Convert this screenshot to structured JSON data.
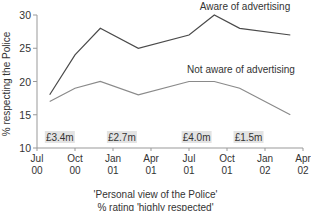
{
  "chart_data": {
    "type": "line",
    "title": "'Personal view of the Police'",
    "subtitle": "% rating 'highly respected'",
    "xlabel": "",
    "ylabel": "% respecting the Police",
    "ylim": [
      10,
      30
    ],
    "yticks": [
      10,
      15,
      20,
      25,
      30
    ],
    "xticks": [
      {
        "label": [
          "Jul",
          "00"
        ],
        "month": 0
      },
      {
        "label": [
          "Oct",
          "00"
        ],
        "month": 3
      },
      {
        "label": [
          "Jan",
          "01"
        ],
        "month": 6
      },
      {
        "label": [
          "Apr",
          "01"
        ],
        "month": 9
      },
      {
        "label": [
          "Jul",
          "01"
        ],
        "month": 12
      },
      {
        "label": [
          "Oct",
          "01"
        ],
        "month": 15
      },
      {
        "label": [
          "Jan",
          "02"
        ],
        "month": 18
      },
      {
        "label": [
          "Apr",
          "02"
        ],
        "month": 21
      }
    ],
    "x": [
      "Aug 00",
      "Oct 00",
      "Dec 00",
      "Mar 01",
      "Jul 01",
      "Sep 01",
      "Nov 01",
      "Mar 02"
    ],
    "x_month": [
      1,
      3,
      5,
      8,
      12,
      14,
      16,
      20
    ],
    "series": [
      {
        "name": "Aware of advertising",
        "values": [
          18,
          24,
          28,
          25,
          27,
          30,
          28,
          27
        ],
        "color": "#4a4a4a",
        "label_pos": {
          "x": 245,
          "y": 10
        }
      },
      {
        "name": "Not aware of advertising",
        "values": [
          17,
          19,
          20,
          18,
          20,
          20,
          19,
          15
        ],
        "color": "#8a8a8a",
        "label_pos": {
          "x": 241,
          "y": 73
        }
      }
    ],
    "annotations": [
      {
        "text": "£3.4m",
        "month": 1.8
      },
      {
        "text": "£2.7m",
        "month": 6.7
      },
      {
        "text": "£4.0m",
        "month": 12.6
      },
      {
        "text": "£1.5m",
        "month": 16.7
      }
    ],
    "grid": false,
    "legend": "inline labels"
  },
  "caption": {
    "line1": "'Personal view of the Police'",
    "line2": "% rating 'highly respected'"
  }
}
